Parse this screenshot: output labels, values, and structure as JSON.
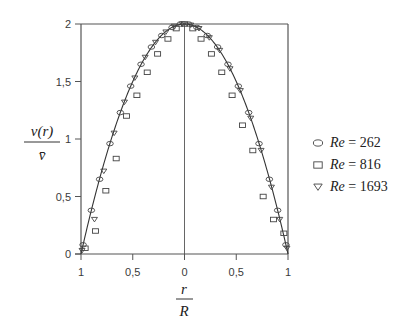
{
  "chart_data": {
    "type": "line",
    "title": "",
    "xlabel": "r/R",
    "ylabel": "v(r)/v̄",
    "xlabel_parts": {
      "num": "r",
      "den": "R"
    },
    "ylabel_parts": {
      "num": "v(r)",
      "den": "v̄"
    },
    "x_ticks": [
      -1,
      -0.5,
      0,
      0.5,
      1
    ],
    "x_tick_labels": [
      "1",
      "0,5",
      "0",
      "0,5",
      "1"
    ],
    "y_ticks": [
      0,
      0.5,
      1,
      1.5,
      2
    ],
    "y_tick_labels": [
      "0",
      "0,5",
      "1",
      "1,5",
      "2"
    ],
    "xlim": [
      -1,
      1
    ],
    "ylim": [
      0,
      2
    ],
    "grid": false,
    "legend_position": "right",
    "theory_curve": {
      "name": "Poiseuille parabola",
      "formula": "2*(1-x^2)"
    },
    "series": [
      {
        "name": "Re = 262",
        "label_prefix": "Re",
        "label_value": "262",
        "marker": "ellipse",
        "x": [
          -0.98,
          -0.9,
          -0.82,
          -0.72,
          -0.62,
          -0.52,
          -0.42,
          -0.32,
          -0.22,
          -0.12,
          -0.04,
          0.04,
          0.12,
          0.22,
          0.32,
          0.42,
          0.52,
          0.62,
          0.72,
          0.82,
          0.9,
          0.98
        ],
        "values": [
          0.08,
          0.38,
          0.65,
          0.96,
          1.23,
          1.46,
          1.65,
          1.8,
          1.9,
          1.97,
          2.0,
          2.0,
          1.97,
          1.9,
          1.8,
          1.65,
          1.46,
          1.23,
          0.96,
          0.65,
          0.38,
          0.08
        ]
      },
      {
        "name": "Re = 816",
        "label_prefix": "Re",
        "label_value": "816",
        "marker": "square",
        "x": [
          -0.96,
          -0.86,
          -0.76,
          -0.66,
          -0.56,
          -0.46,
          -0.36,
          -0.26,
          -0.16,
          -0.08,
          0.0,
          0.08,
          0.16,
          0.26,
          0.36,
          0.46,
          0.56,
          0.66,
          0.76,
          0.86,
          0.96
        ],
        "values": [
          0.05,
          0.2,
          0.55,
          0.83,
          1.2,
          1.38,
          1.58,
          1.74,
          1.87,
          1.96,
          2.0,
          1.96,
          1.87,
          1.74,
          1.58,
          1.38,
          1.12,
          0.9,
          0.5,
          0.3,
          0.18
        ]
      },
      {
        "name": "Re = 1693",
        "label_prefix": "Re",
        "label_value": "1693",
        "marker": "triangle-down",
        "x": [
          -0.99,
          -0.87,
          -0.78,
          -0.68,
          -0.58,
          -0.48,
          -0.38,
          -0.28,
          -0.18,
          -0.1,
          -0.02,
          0.06,
          0.14,
          0.24,
          0.34,
          0.44,
          0.54,
          0.64,
          0.74,
          0.84,
          0.92,
          0.99
        ],
        "values": [
          0.03,
          0.3,
          0.72,
          1.05,
          1.32,
          1.53,
          1.71,
          1.84,
          1.93,
          1.98,
          2.0,
          1.99,
          1.96,
          1.88,
          1.77,
          1.61,
          1.42,
          1.18,
          0.9,
          0.58,
          0.3,
          0.05
        ]
      }
    ]
  },
  "legend": {
    "items": [
      {
        "marker": "ellipse",
        "prefix": "Re",
        "eq": "=",
        "value": "262"
      },
      {
        "marker": "square",
        "prefix": "Re",
        "eq": "=",
        "value": "816"
      },
      {
        "marker": "triangle-down",
        "prefix": "Re",
        "eq": "=",
        "value": "1693"
      }
    ]
  },
  "colors": {
    "axis": "#555555",
    "curve": "#333333",
    "marker": "#444444",
    "text": "#333333"
  }
}
